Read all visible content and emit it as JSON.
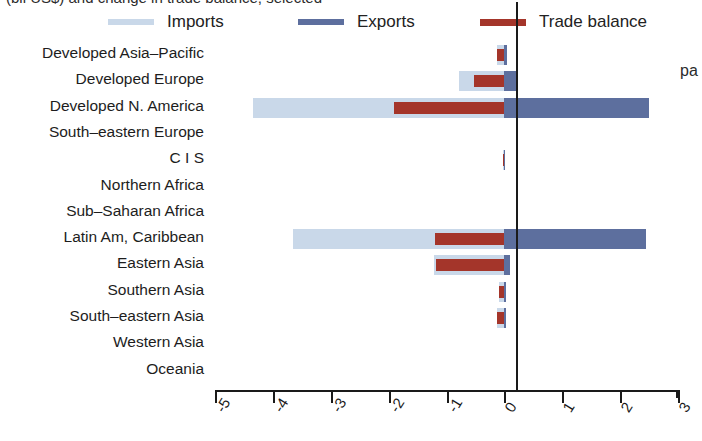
{
  "header": {
    "clipped_title": "(bil US$) and change in trade balance, selected",
    "clipped_right_text": "pa"
  },
  "legend": {
    "position": "top",
    "items": [
      {
        "label": "Imports",
        "color": "#c9d8e9",
        "name": "legend-imports"
      },
      {
        "label": "Exports",
        "color": "#5d6f9e",
        "name": "legend-exports"
      },
      {
        "label": "Trade balance",
        "color": "#a4352a",
        "name": "legend-trade-balance"
      }
    ]
  },
  "axis": {
    "ticks": [
      "-5",
      "-4",
      "-3",
      "-2",
      "-1",
      "0",
      "1",
      "2",
      "3"
    ],
    "min": -5,
    "max": 3
  },
  "chart_data": {
    "type": "bar",
    "title": "(bil US$) and change in trade balance, selected",
    "xlabel": "",
    "ylabel": "",
    "xlim": [
      -5,
      3
    ],
    "grid": false,
    "orientation": "horizontal",
    "legend_position": "top",
    "categories": [
      "Developed Asia–Pacific",
      "Developed Europe",
      "Developed N. America",
      "South–eastern Europe",
      "C I S",
      "Northern Africa",
      "Sub–Saharan Africa",
      "Latin Am, Caribbean",
      "Eastern Asia",
      "Southern Asia",
      "South–eastern Asia",
      "Western Asia",
      "Oceania"
    ],
    "series": [
      {
        "name": "Imports",
        "color": "#c9d8e9",
        "values": [
          -0.12,
          -0.78,
          -4.35,
          0.0,
          -0.03,
          0.0,
          0.0,
          -3.65,
          -1.22,
          -0.1,
          -0.12,
          0.0,
          0.0
        ]
      },
      {
        "name": "Exports",
        "color": "#5d6f9e",
        "values": [
          0.04,
          0.2,
          2.5,
          0.0,
          0.01,
          0.0,
          0.0,
          2.45,
          0.1,
          0.02,
          0.02,
          0.0,
          0.0
        ]
      },
      {
        "name": "Trade balance",
        "color": "#a4352a",
        "values": [
          -0.12,
          -0.52,
          -1.9,
          0.0,
          -0.03,
          0.0,
          0.0,
          -1.2,
          -1.18,
          -0.1,
          -0.12,
          0.0,
          0.0
        ]
      }
    ]
  }
}
